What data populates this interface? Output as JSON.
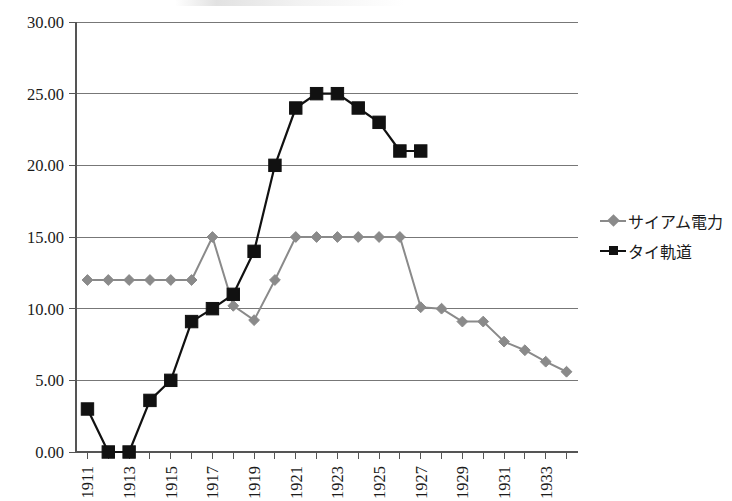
{
  "chart_data": {
    "type": "line",
    "title": "",
    "xlabel": "",
    "ylabel": "",
    "ylim": [
      0,
      30
    ],
    "ytick_step": 5,
    "yticks": [
      "0.00",
      "5.00",
      "10.00",
      "15.00",
      "20.00",
      "25.00",
      "30.00"
    ],
    "grid": true,
    "legend_position": "right",
    "x": [
      1911,
      1912,
      1913,
      1914,
      1915,
      1916,
      1917,
      1918,
      1919,
      1920,
      1921,
      1922,
      1923,
      1924,
      1925,
      1926,
      1927,
      1928,
      1929,
      1930,
      1931,
      1932,
      1933,
      1934
    ],
    "xticklabels": [
      "1911",
      "1913",
      "1915",
      "1917",
      "1919",
      "1921",
      "1923",
      "1925",
      "1927",
      "1929",
      "1931",
      "1933"
    ],
    "xtick_years": [
      1911,
      1913,
      1915,
      1917,
      1919,
      1921,
      1923,
      1925,
      1927,
      1929,
      1931,
      1933
    ],
    "series": [
      {
        "name": "サイアム電力",
        "color": "#8a8a8a",
        "marker": "diamond",
        "values": [
          12.0,
          12.0,
          12.0,
          12.0,
          12.0,
          12.0,
          15.0,
          10.2,
          9.2,
          12.0,
          15.0,
          15.0,
          15.0,
          15.0,
          15.0,
          15.0,
          10.1,
          10.0,
          9.1,
          9.1,
          7.7,
          7.1,
          6.3,
          5.6
        ]
      },
      {
        "name": "タイ軌道",
        "color": "#111111",
        "marker": "square",
        "values": [
          3.0,
          0.0,
          0.0,
          3.6,
          5.0,
          9.1,
          10.0,
          11.0,
          14.0,
          20.0,
          24.0,
          25.0,
          25.0,
          24.0,
          23.0,
          21.0,
          21.0,
          null,
          null,
          null,
          null,
          null,
          null,
          null
        ]
      }
    ]
  },
  "legend": {
    "items": [
      {
        "label": "サイアム電力",
        "swatch": "gray-diamond-line"
      },
      {
        "label": "タイ軌道",
        "swatch": "black-square-line"
      }
    ]
  },
  "colors": {
    "series_a": "#8a8a8a",
    "series_b": "#111111",
    "grid": "#777777",
    "axis": "#555555",
    "background": "#ffffff"
  }
}
